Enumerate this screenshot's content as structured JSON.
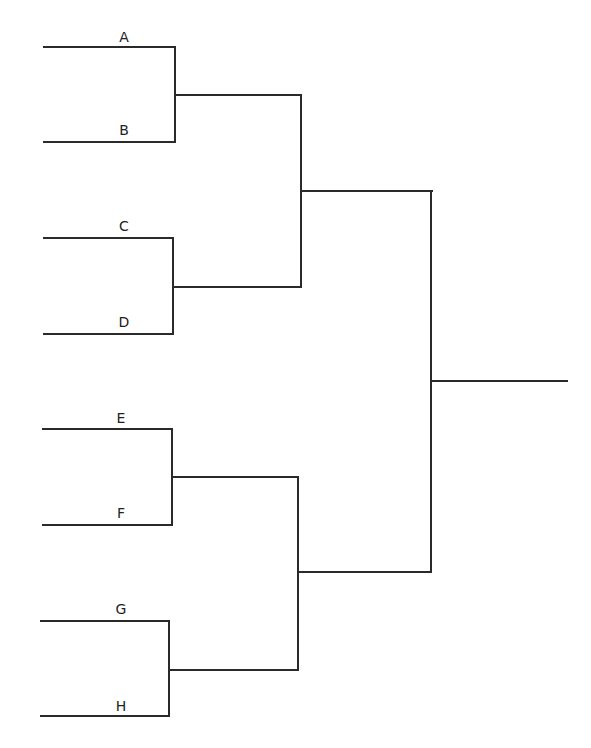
{
  "bracket": {
    "teams": [
      {
        "label": "A"
      },
      {
        "label": "B"
      },
      {
        "label": "C"
      },
      {
        "label": "D"
      },
      {
        "label": "E"
      },
      {
        "label": "F"
      },
      {
        "label": "G"
      },
      {
        "label": "H"
      }
    ],
    "rounds": [
      "Round 1",
      "Semifinal",
      "Final",
      "Winner"
    ],
    "line_color": "#2a2a2a"
  }
}
